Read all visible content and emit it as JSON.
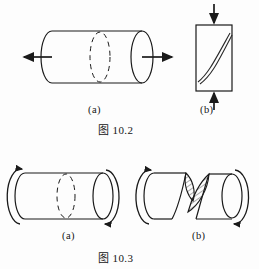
{
  "page": {
    "background_color": "#fdfdfd",
    "ink_color": "#1a1a1a",
    "width": 259,
    "height": 269
  },
  "figures": [
    {
      "id": "fig-10-2",
      "caption": "图 10.2",
      "panels": [
        {
          "label": "(a)",
          "subject": "cylindrical-specimen-in-tension",
          "shape": "cylinder",
          "load": "tension",
          "arrow_direction": "outward-both-ends",
          "failure_plane": "transverse-dashed-ellipse"
        },
        {
          "label": "(b)",
          "subject": "prismatic-specimen-in-compression",
          "shape": "rectangular-block",
          "load": "compression",
          "arrow_direction": "inward-top-and-bottom",
          "failure_plane": "inclined-shear-crack"
        }
      ]
    },
    {
      "id": "fig-10-3",
      "caption": "图 10.3",
      "panels": [
        {
          "label": "(a)",
          "subject": "cylindrical-shaft-in-torsion",
          "shape": "cylinder",
          "load": "torsion",
          "arrow_direction": "curved-torque-both-ends",
          "failure_plane": "transverse-dashed-ellipse"
        },
        {
          "label": "(b)",
          "subject": "torsional-helical-fracture",
          "shape": "cylinder-fractured",
          "load": "torsion",
          "arrow_direction": "curved-torque-both-ends",
          "failure_plane": "helical-hatched-fracture-surfaces"
        }
      ]
    }
  ],
  "labels": {
    "fig102_a": "(a)",
    "fig102_b": "(b)",
    "fig102_caption": "图 10.2",
    "fig103_a": "(a)",
    "fig103_b": "(b)",
    "fig103_caption": "图 10.3"
  }
}
